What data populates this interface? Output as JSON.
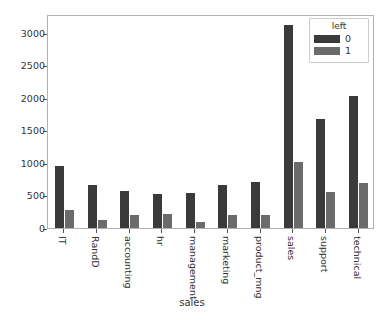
{
  "chart_data": {
    "type": "bar",
    "title": "",
    "xlabel": "sales",
    "ylabel": "",
    "categories": [
      "IT",
      "RandD",
      "accounting",
      "hr",
      "management",
      "marketing",
      "product_mng",
      "sales",
      "support",
      "technical"
    ],
    "series": [
      {
        "name": "0",
        "color": "#3a3a3a",
        "values": [
          954,
          666,
          563,
          524,
          539,
          655,
          704,
          3126,
          1674,
          2023
        ]
      },
      {
        "name": "1",
        "color": "#6b6b6b",
        "values": [
          273,
          121,
          204,
          215,
          91,
          203,
          198,
          1014,
          555,
          697
        ]
      }
    ],
    "legend": {
      "title": "left",
      "position": "upper right",
      "entries": [
        {
          "label": "0",
          "color": "#3a3a3a"
        },
        {
          "label": "1",
          "color": "#6b6b6b"
        }
      ]
    },
    "yticks": [
      0,
      500,
      1000,
      1500,
      2000,
      2500,
      3000
    ],
    "ytick_labels": [
      "0",
      "500",
      "1000",
      "1500",
      "2000",
      "2500",
      "3000"
    ],
    "ylim": [
      0,
      3290
    ],
    "grid": false,
    "xtick_rotation": 90
  }
}
